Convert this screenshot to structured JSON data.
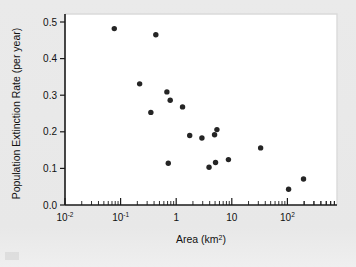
{
  "figure": {
    "background_color": "#e9e9e9",
    "plot_background_color": "#ffffff",
    "point_color": "#252525",
    "axis_color": "#1a1a1a"
  },
  "axes": {
    "y_label": "Population Extinction Rate (per year)",
    "x_label": "Area (km²)",
    "y_ticks": [
      "0.0",
      "0.1",
      "0.2",
      "0.3",
      "0.4",
      "0.5"
    ],
    "x_ticks": [
      {
        "base": "10",
        "exp": "-2"
      },
      {
        "base": "10",
        "exp": "-1"
      },
      {
        "base": "1",
        "exp": ""
      },
      {
        "base": "10",
        "exp": ""
      },
      {
        "base": "10",
        "exp": "2"
      }
    ]
  },
  "chart_data": {
    "type": "scatter",
    "title": "",
    "xlabel": "Area (km2)",
    "ylabel": "Population Extinction Rate (per year)",
    "xscale": "log",
    "yscale": "linear",
    "xlim": [
      0.01,
      1000
    ],
    "ylim": [
      0.0,
      0.5
    ],
    "xtick_values": [
      0.01,
      0.1,
      1,
      10,
      100
    ],
    "xtick_labels": [
      "10^-2",
      "10^-1",
      "1",
      "10",
      "10^2"
    ],
    "ytick_values": [
      0.0,
      0.1,
      0.2,
      0.3,
      0.4,
      0.5
    ],
    "ytick_labels": [
      "0.0",
      "0.1",
      "0.2",
      "0.3",
      "0.4",
      "0.5"
    ],
    "grid": false,
    "legend": null,
    "series": [
      {
        "name": "populations",
        "marker": "circle",
        "color": "#252525",
        "points": [
          {
            "x": 0.077,
            "y": 0.482
          },
          {
            "x": 0.43,
            "y": 0.465
          },
          {
            "x": 0.22,
            "y": 0.331
          },
          {
            "x": 0.68,
            "y": 0.309
          },
          {
            "x": 0.35,
            "y": 0.253
          },
          {
            "x": 0.78,
            "y": 0.286
          },
          {
            "x": 1.3,
            "y": 0.268
          },
          {
            "x": 1.75,
            "y": 0.19
          },
          {
            "x": 2.9,
            "y": 0.183
          },
          {
            "x": 4.9,
            "y": 0.192
          },
          {
            "x": 5.4,
            "y": 0.206
          },
          {
            "x": 0.72,
            "y": 0.114
          },
          {
            "x": 3.9,
            "y": 0.103
          },
          {
            "x": 5.1,
            "y": 0.116
          },
          {
            "x": 8.7,
            "y": 0.124
          },
          {
            "x": 33.0,
            "y": 0.156
          },
          {
            "x": 105.0,
            "y": 0.043
          },
          {
            "x": 195.0,
            "y": 0.071
          }
        ]
      }
    ]
  }
}
